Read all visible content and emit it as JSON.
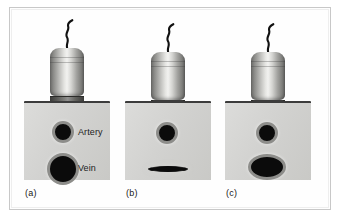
{
  "figure": {
    "background_color": "#ffffff",
    "frame_color": "#c8c8c8"
  },
  "colors": {
    "tissue": "#d2d2d0",
    "skin_line": "#3c3c3c",
    "vessel_lumen": "#0b0b0b",
    "vessel_wall": "#8d8d8a",
    "probe_highlight": "#f2f2f0",
    "probe_shadow": "#616160",
    "cable": "#111111",
    "label_text": "#1d1d1d"
  },
  "panels": [
    {
      "id": "a",
      "caption": "(a)",
      "state": "no compression",
      "probe": {
        "icon": "ultrasound-transducer-icon",
        "cable_icon": "probe-cable-icon",
        "pressing": false
      },
      "vessels": [
        {
          "name": "artery",
          "label": "Artery",
          "shape": "circle",
          "compressed": false
        },
        {
          "name": "vein",
          "label": "Vein",
          "shape": "circle",
          "compressed": false
        }
      ]
    },
    {
      "id": "b",
      "caption": "(b)",
      "state": "full compression - vein collapsed",
      "probe": {
        "icon": "ultrasound-transducer-icon",
        "cable_icon": "probe-cable-icon",
        "pressing": true
      },
      "vessels": [
        {
          "name": "artery",
          "label": "",
          "shape": "circle",
          "compressed": false
        },
        {
          "name": "vein",
          "label": "",
          "shape": "flattened",
          "compressed": true
        }
      ]
    },
    {
      "id": "c",
      "caption": "(c)",
      "state": "partial compression - vein ovalised",
      "probe": {
        "icon": "ultrasound-transducer-icon",
        "cable_icon": "probe-cable-icon",
        "pressing": true
      },
      "vessels": [
        {
          "name": "artery",
          "label": "",
          "shape": "circle",
          "compressed": false
        },
        {
          "name": "vein",
          "label": "",
          "shape": "ellipse",
          "compressed": true
        }
      ]
    }
  ]
}
